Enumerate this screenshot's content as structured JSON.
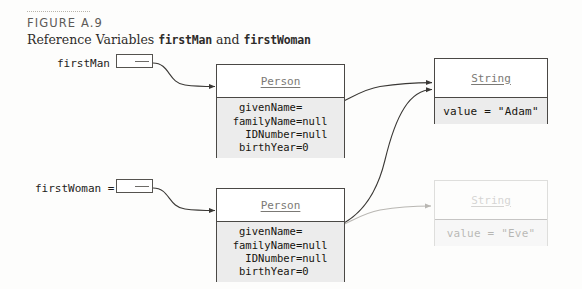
{
  "figure": {
    "number": "FIGURE A.9",
    "caption_prefix": "Reference Variables ",
    "caption_var1": "firstMan",
    "caption_and": " and ",
    "caption_var2": "firstWoman"
  },
  "variables": [
    {
      "label": "firstMan ="
    },
    {
      "label": "firstWoman ="
    }
  ],
  "objects": {
    "person1": {
      "type": "Person",
      "fields": [
        {
          "name": "givenName",
          "eq": "=",
          "value": ""
        },
        {
          "name": "familyName",
          "eq": "=",
          "value": "null"
        },
        {
          "name": "IDNumber",
          "eq": "=",
          "value": "null"
        },
        {
          "name": "birthYear",
          "eq": "=",
          "value": "0"
        }
      ]
    },
    "person2": {
      "type": "Person",
      "fields": [
        {
          "name": "givenName",
          "eq": "=",
          "value": ""
        },
        {
          "name": "familyName",
          "eq": "=",
          "value": "null"
        },
        {
          "name": "IDNumber",
          "eq": "=",
          "value": "null"
        },
        {
          "name": "birthYear",
          "eq": "=",
          "value": "0"
        }
      ]
    },
    "string1": {
      "type": "String",
      "value_line": "value = \"Adam\""
    },
    "string2": {
      "type": "String",
      "value_line": "value = \"Eve\""
    }
  },
  "colors": {
    "ink": "#17150f",
    "box_border": "#4a4845",
    "body_fill": "#ececec",
    "type_label": "#7b7975",
    "arrow": "#3a3835",
    "arrow_faded": "#b9b7b3",
    "page_bg": "#fdfdfc"
  }
}
